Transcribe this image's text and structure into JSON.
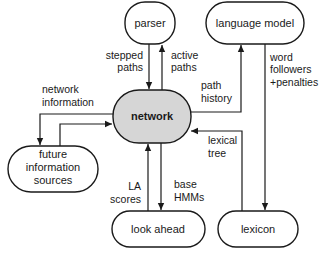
{
  "nodes": {
    "parser": {
      "label": "parser"
    },
    "language_model": {
      "label": "language model"
    },
    "network": {
      "label": "network"
    },
    "future_info": {
      "lines": [
        "future",
        "information",
        "sources"
      ]
    },
    "look_ahead": {
      "label": "look ahead"
    },
    "lexicon": {
      "label": "lexicon"
    }
  },
  "edges": {
    "stepped_paths": {
      "lines": [
        "stepped",
        "paths"
      ],
      "from": "parser",
      "to": "network"
    },
    "active_paths": {
      "lines": [
        "active",
        "paths"
      ],
      "from": "network",
      "to": "parser"
    },
    "path_history": {
      "lines": [
        "path",
        "history"
      ],
      "from": "network",
      "to": "language model"
    },
    "word_followers": {
      "lines": [
        "word",
        "followers",
        "+penalties"
      ],
      "from": "language model",
      "to": "lexicon"
    },
    "network_information": {
      "lines": [
        "network",
        "information"
      ],
      "from": "network",
      "to": "future information sources"
    },
    "future_to_network": {
      "from": "future information sources",
      "to": "network"
    },
    "lexical_tree": {
      "lines": [
        "lexical",
        "tree"
      ],
      "from": "lexicon",
      "to": "network"
    },
    "la_scores": {
      "lines": [
        "LA",
        "scores"
      ],
      "from": "look ahead",
      "to": "network"
    },
    "base_hmms": {
      "lines": [
        "base",
        "HMMs"
      ],
      "from": "network",
      "to": "look ahead"
    }
  },
  "colors": {
    "hub_fill": "#d6d6d6",
    "stroke": "#1a1a1a"
  }
}
